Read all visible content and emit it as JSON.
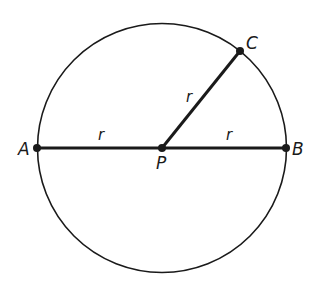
{
  "diagram": {
    "circle": {
      "cx": 162,
      "cy": 148,
      "r": 124
    },
    "points": [
      {
        "id": "A",
        "label": "A",
        "x": 37,
        "y": 148,
        "lx": 18,
        "ly": 155
      },
      {
        "id": "B",
        "label": "B",
        "x": 286,
        "y": 148,
        "lx": 292,
        "ly": 155
      },
      {
        "id": "P",
        "label": "P",
        "x": 162,
        "y": 148,
        "lx": 156,
        "ly": 169
      },
      {
        "id": "C",
        "label": "C",
        "x": 240,
        "y": 51,
        "lx": 246,
        "ly": 49
      }
    ],
    "segments": [
      {
        "from": "A",
        "to": "P",
        "label": "r",
        "lx": 100,
        "ly": 140
      },
      {
        "from": "P",
        "to": "B",
        "label": "r",
        "lx": 227,
        "ly": 140
      },
      {
        "from": "P",
        "to": "C",
        "label": "r",
        "lx": 188,
        "ly": 102
      }
    ],
    "colors": {
      "stroke": "#1a1a1a",
      "background": "#ffffff"
    }
  }
}
